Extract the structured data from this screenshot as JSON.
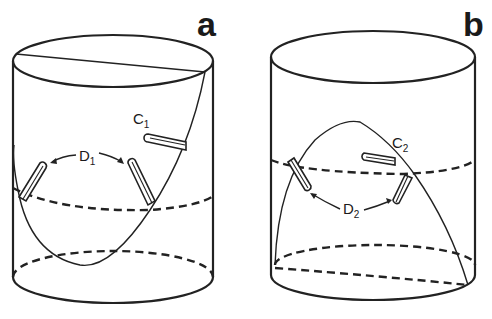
{
  "figure": {
    "panels": [
      {
        "id": "a",
        "letter": "a",
        "label_C": "C",
        "label_C_sub": "1",
        "label_D": "D",
        "label_D_sub": "1"
      },
      {
        "id": "b",
        "letter": "b",
        "label_C": "C",
        "label_C_sub": "2",
        "label_D": "D",
        "label_D_sub": "2"
      }
    ],
    "colors": {
      "line": "#222222",
      "background": "#ffffff"
    }
  }
}
